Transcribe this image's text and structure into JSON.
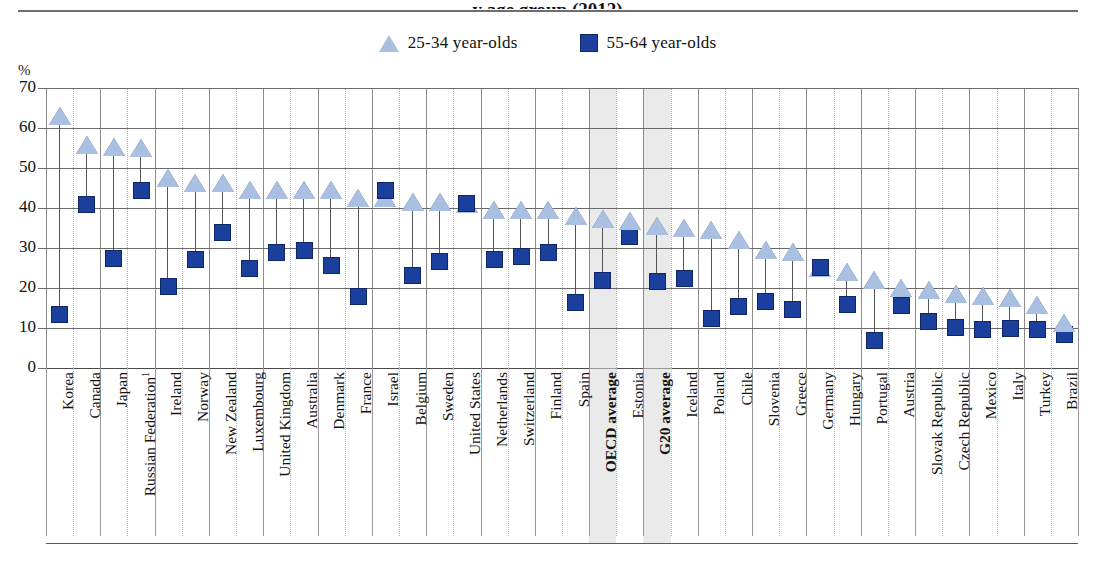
{
  "header": {
    "title_fragment": "y age group (2012)",
    "y_axis_unit": "%"
  },
  "legend": {
    "position": "top-center",
    "items": [
      {
        "marker": "triangle-up-icon",
        "label": "25-34 year-olds",
        "color": "#aac0e2"
      },
      {
        "marker": "square-icon",
        "label": "55-64 year-olds",
        "color": "#1b3f9c"
      }
    ]
  },
  "colors": {
    "young_marker": "#aac0e2",
    "old_marker": "#1b3f9c",
    "marker_outline": "#0f2568",
    "gridline": "#6b6b6b",
    "highlight_band": "#d9d9d9"
  },
  "chart_data": {
    "type": "scatter",
    "title": "y age group (2012)",
    "xlabel": "",
    "ylabel": "%",
    "ylim": [
      0,
      70
    ],
    "yticks": [
      0,
      10,
      20,
      30,
      40,
      50,
      60,
      70
    ],
    "grid": true,
    "legend_position": "top-center",
    "highlighted_categories": [
      "OECD average",
      "G20 average"
    ],
    "footnote_marker_categories": [
      "Russian Federation"
    ],
    "categories": [
      "Korea",
      "Canada",
      "Japan",
      "Russian Federation¹",
      "Ireland",
      "Norway",
      "New Zealand",
      "Luxembourg",
      "United Kingdom",
      "Australia",
      "Denmark",
      "France",
      "Israel",
      "Belgium",
      "Sweden",
      "United States",
      "Netherlands",
      "Switzerland",
      "Finland",
      "Spain",
      "OECD average",
      "Estonia",
      "G20 average",
      "Iceland",
      "Poland",
      "Chile",
      "Slovenia",
      "Greece",
      "Germany",
      "Hungary",
      "Portugal",
      "Austria",
      "Slovak Republic",
      "Czech Republic",
      "Mexico",
      "Italy",
      "Turkey",
      "Brazil"
    ],
    "series": [
      {
        "name": "25-34 year-olds",
        "marker": "triangle",
        "values": [
          63.0,
          55.8,
          55.3,
          55.0,
          47.4,
          46.3,
          46.3,
          44.5,
          44.6,
          44.6,
          44.5,
          42.5,
          42.5,
          41.6,
          41.6,
          41.0,
          39.5,
          39.5,
          39.4,
          38.0,
          37.2,
          36.8,
          35.5,
          35.1,
          34.6,
          32.0,
          29.5,
          29.0,
          25.0,
          24.0,
          22.0,
          20.0,
          19.5,
          18.5,
          18.0,
          17.5,
          15.8,
          11.2
        ]
      },
      {
        "name": "55-64 year-olds",
        "marker": "square",
        "values": [
          13.5,
          40.8,
          27.4,
          44.5,
          20.3,
          27.1,
          33.8,
          24.8,
          29.0,
          29.3,
          25.6,
          18.0,
          44.5,
          23.2,
          26.6,
          41.2,
          27.2,
          28.0,
          28.8,
          16.4,
          22.0,
          33.0,
          21.6,
          22.5,
          12.4,
          15.3,
          16.7,
          14.7,
          25.2,
          16.0,
          7.0,
          15.6,
          11.6,
          10.2,
          9.7,
          9.9,
          9.6,
          8.5
        ]
      }
    ]
  }
}
